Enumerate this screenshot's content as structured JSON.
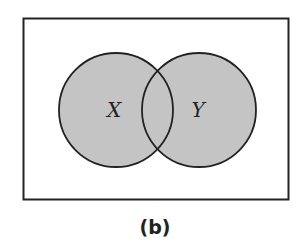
{
  "diagram": {
    "type": "venn",
    "universe": {
      "x": 23,
      "y": 18,
      "width": 266,
      "height": 182
    },
    "sets": [
      {
        "label": "X",
        "cx": 116,
        "cy": 110,
        "r": 57
      },
      {
        "label": "Y",
        "cx": 199,
        "cy": 110,
        "r": 57
      }
    ],
    "shading": "both sets shaded (union X ∪ Y)",
    "colors": {
      "fill": "#c4c4c4",
      "stroke": "#222222",
      "background": "#ffffff"
    }
  },
  "caption": "(b)"
}
